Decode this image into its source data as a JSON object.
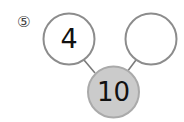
{
  "problem_marker": "⑤",
  "nodes": {
    "left": {
      "value": "4"
    },
    "right": {
      "value": ""
    },
    "bottom": {
      "value": "10"
    }
  },
  "colors": {
    "circle_stroke": "#8c8c8c",
    "bottom_fill": "#cbcbcb",
    "bottom_stroke": "#aaaaaa",
    "line": "#7a7a7a"
  }
}
